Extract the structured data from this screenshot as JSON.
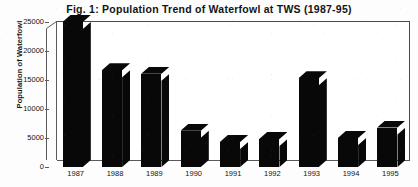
{
  "chart_data": {
    "type": "bar",
    "title": "Fig. 1:  Population Trend of Waterfowl at TWS (1987-95)",
    "xlabel": "",
    "ylabel": "Population of Waterfowl",
    "categories": [
      "1987",
      "1988",
      "1989",
      "1990",
      "1991",
      "1992",
      "1993",
      "1994",
      "1995"
    ],
    "values": [
      25000,
      16700,
      16100,
      6250,
      4300,
      4850,
      15300,
      5000,
      6800
    ],
    "ylim": [
      0,
      25000
    ],
    "yticks": [
      0,
      5000,
      10000,
      15000,
      20000,
      25000
    ],
    "ytick_labels": [
      "0",
      "5000",
      "10000",
      "15000",
      "20000",
      "25000"
    ],
    "grid": false,
    "legend": "none",
    "style": "3d-bar",
    "bar_color": "#080808",
    "frame_color": "#4a4a4a",
    "background": "#ffffff"
  }
}
